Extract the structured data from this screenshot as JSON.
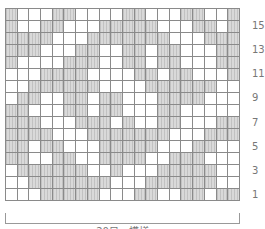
{
  "diagram": {
    "columns": 20,
    "rows": 16,
    "shaded_color": "#d9d9d9",
    "grid_line_color": "#8a8a8a",
    "pattern_top_to_bottom": [
      "SWWWSSWWWWSSWWWSSWWS",
      "SWWSSWWWSSSSSWWWSSWS",
      "SSSSWWWSSSSSSSWWWSSS",
      "SSSWWWSSWWSSWSSWWWSS",
      "SWWWWSSSWWSSWSSWWWSS",
      "WWWSSSSWWWWSSWSSWWWS",
      "WWSSSSSSWWWWSSSSSSWW",
      "WSSWWSSWSSWWWSSSSWWW",
      "SSWWWSSWSSWWWSSWWWWW",
      "SSSWWWSSSWSWWSSWWWSS",
      "SSSSWWWSSSSSSSWWWSSS",
      "SSWSSWWWSSSSSWWWSSWW",
      "SSWWSSWWSSSSWWSSSWWW",
      "WSSSSSSWWSWWWSSSSSWW",
      "WWSSSSSSSWWWSSSSSSWW",
      "WWWSSSSSWWWSSWWSSWSS"
    ],
    "row_labels": [
      {
        "text": "15",
        "row": 15
      },
      {
        "text": "13",
        "row": 13
      },
      {
        "text": "11",
        "row": 11
      },
      {
        "text": "9",
        "row": 9
      },
      {
        "text": "7",
        "row": 7
      },
      {
        "text": "5",
        "row": 5
      },
      {
        "text": "3",
        "row": 3
      },
      {
        "text": "1",
        "row": 1
      }
    ],
    "repeat_caption": "20目一模様"
  }
}
